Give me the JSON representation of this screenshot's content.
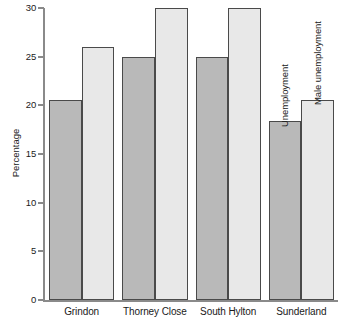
{
  "chart_data": {
    "type": "bar",
    "title": "",
    "xlabel": "",
    "ylabel": "Percentage",
    "ylim": [
      0,
      30
    ],
    "yticks": [
      0,
      5,
      10,
      15,
      20,
      25,
      30
    ],
    "ytick_labels": [
      "0",
      "5",
      "10",
      "15",
      "20",
      "25",
      "30"
    ],
    "grid": false,
    "legend_position": "in-plot-rotated-over-last-group",
    "categories": [
      "Grindon",
      "Thorney Close",
      "South Hylton",
      "Sunderland"
    ],
    "series": [
      {
        "name": "Unemployment",
        "color": "#b9b9b9",
        "values": [
          20.6,
          25.0,
          25.0,
          18.4
        ]
      },
      {
        "name": "Male unemployment",
        "color": "#e8e8e8",
        "values": [
          26.0,
          30.0,
          30.0,
          20.6
        ]
      }
    ],
    "annotations": [
      {
        "text": "Unemployment",
        "rotation": -90,
        "target": "Sunderland/Unemployment"
      },
      {
        "text": "Male unemployment",
        "rotation": -90,
        "target": "Sunderland/Male unemployment"
      }
    ]
  },
  "colors": {
    "series_unemployment": "#b9b9b9",
    "series_male_unemployment": "#e8e8e8",
    "bar_outline": "#4a4a4a",
    "axis": "#8a8a8a",
    "text": "#1a1a1a",
    "background": "#ffffff"
  }
}
